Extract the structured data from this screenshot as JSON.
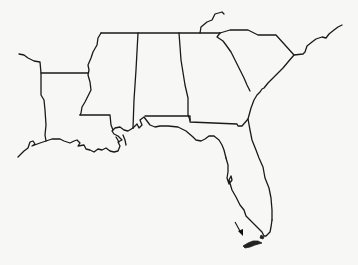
{
  "map": {
    "type": "outline-map",
    "region": "Southeastern United States",
    "states_outlined": [
      "Louisiana",
      "Mississippi",
      "Alabama",
      "Georgia",
      "South Carolina",
      "Florida"
    ],
    "colors": {
      "background": "#f7f7f5",
      "line": "#1a1a1a",
      "highlight": "#222222"
    },
    "annotations": [
      {
        "type": "arrow",
        "target": "south-florida-keys",
        "description": "arrow pointing at shaded area at southern tip of Florida"
      }
    ],
    "labels": []
  }
}
